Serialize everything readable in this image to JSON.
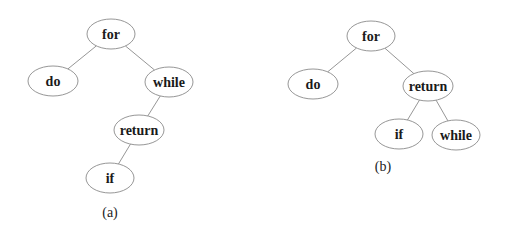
{
  "figure": {
    "rules": {
      "top": {
        "x1": 80,
        "x2": 497,
        "y": 2,
        "color": "#555555"
      },
      "bottom": {
        "x1": 13,
        "x2": 300,
        "y": 237,
        "color": "#444444"
      }
    },
    "trees": [
      {
        "id": "a",
        "caption": "(a)",
        "caption_pos": [
          110,
          212
        ],
        "nodes": [
          {
            "id": "for",
            "label": "for",
            "cx": 111,
            "cy": 34,
            "rx": 24,
            "ry": 15
          },
          {
            "id": "do",
            "label": "do",
            "cx": 53,
            "cy": 81,
            "rx": 25,
            "ry": 15
          },
          {
            "id": "while",
            "label": "while",
            "cx": 169,
            "cy": 82,
            "rx": 24,
            "ry": 15
          },
          {
            "id": "return",
            "label": "return",
            "cx": 139,
            "cy": 130,
            "rx": 25,
            "ry": 15
          },
          {
            "id": "if",
            "label": "if",
            "cx": 110,
            "cy": 178,
            "rx": 24,
            "ry": 15
          }
        ],
        "edges": [
          [
            "for",
            "do"
          ],
          [
            "for",
            "while"
          ],
          [
            "while",
            "return"
          ],
          [
            "return",
            "if"
          ]
        ]
      },
      {
        "id": "b",
        "caption": "(b)",
        "caption_pos": [
          383,
          166
        ],
        "nodes": [
          {
            "id": "for",
            "label": "for",
            "cx": 371,
            "cy": 36,
            "rx": 24,
            "ry": 15
          },
          {
            "id": "do",
            "label": "do",
            "cx": 313,
            "cy": 84,
            "rx": 25,
            "ry": 15
          },
          {
            "id": "return",
            "label": "return",
            "cx": 428,
            "cy": 86,
            "rx": 25,
            "ry": 15
          },
          {
            "id": "if",
            "label": "if",
            "cx": 399,
            "cy": 134,
            "rx": 24,
            "ry": 15
          },
          {
            "id": "while",
            "label": "while",
            "cx": 456,
            "cy": 135,
            "rx": 24,
            "ry": 15
          }
        ],
        "edges": [
          [
            "for",
            "do"
          ],
          [
            "for",
            "return"
          ],
          [
            "return",
            "if"
          ],
          [
            "return",
            "while"
          ]
        ]
      }
    ]
  }
}
